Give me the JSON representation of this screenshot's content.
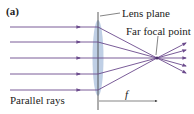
{
  "figure": {
    "panel_label": "(a)",
    "labels": {
      "lens_plane": "Lens plane",
      "far_focal_point": "Far focal point",
      "parallel_rays": "Parallel rays",
      "focal_length": "f"
    },
    "colors": {
      "ray": "#6b4a8c",
      "lens_fill": "#a9bfdc",
      "line": "#333333"
    },
    "rays": {
      "count": 5,
      "y_positions": [
        27,
        42,
        58,
        74,
        90
      ],
      "lens_x": 98,
      "focal_point": [
        157,
        58
      ]
    }
  }
}
